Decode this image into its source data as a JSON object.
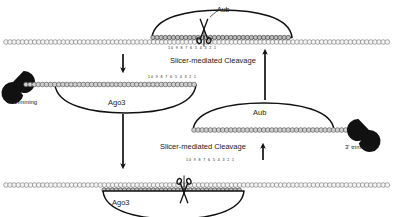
{
  "figure": {
    "background_color": "#ffffff",
    "stroke_color": "#111111",
    "bead_fill_light": "#f2f2f2",
    "bead_fill_gray": "#d9d9d9",
    "bead_stroke": "#5a5a5a",
    "nuclease_color": "#111111"
  },
  "panels": {
    "top": {
      "protein_label": "Aub",
      "ruler": "10 9 8 7 6 5 4 3 2 1",
      "process_label": "Slicer-mediated Cleavage",
      "cleavage_icon": "scissors-icon",
      "target_strand_icon": "bead-chain-strand",
      "guide_strand_icon": "bead-chain-guide"
    },
    "left_middle": {
      "protein_label": "Ago3",
      "ruler": "10 9 8 7 6 5 4 3 2 1",
      "trim_label": "3' trimming",
      "nuclease_icon": "pacman-nuclease-icon"
    },
    "right_middle": {
      "protein_label": "Aub",
      "trim_label": "3' trimming",
      "nuclease_icon": "pacman-nuclease-icon"
    },
    "bottom": {
      "protein_label": "Ago3",
      "ruler": "10 9 8 7 6 5 4 3 2 1",
      "process_label": "Slicer-mediated Cleavage",
      "cleavage_icon": "scissors-icon"
    }
  },
  "arrows": {
    "top_down": "arrow-down-icon",
    "left_long_down": "arrow-down-icon",
    "right_long_up": "arrow-up-icon",
    "right_short_up": "arrow-up-icon"
  }
}
